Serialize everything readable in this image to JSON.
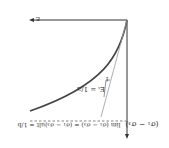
{
  "diagram": {
    "orientation": "rotated-180",
    "colors": {
      "axis": "#333333",
      "curve": "#444444",
      "tangent": "#888888",
      "asymptote": "#666666",
      "background": "#ffffff"
    },
    "axes": {
      "horizontal_label": "ε",
      "vertical_label": "(σ₁ − σ₃)"
    },
    "curve": {
      "description": "hyperbolic stress-strain curve"
    },
    "tangent": {
      "slope_label": "Eᵢ = 1/a",
      "triangle_label": "1"
    },
    "asymptote": {
      "label": "lim (σ₁ − σ₃) = (σ₁ − σ₃)ult = 1/b",
      "limit_subscript": "ε→∞"
    }
  }
}
